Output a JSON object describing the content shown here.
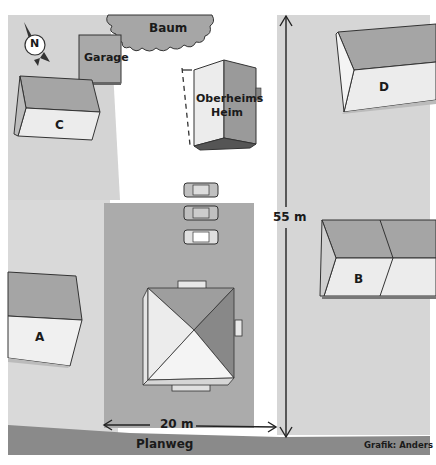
{
  "diagram": {
    "labels": {
      "tree": "Baum",
      "garage": "Garage",
      "main_house_line1": "Oberheims",
      "main_house_line2": "Heim",
      "house_a": "A",
      "house_b": "B",
      "house_c": "C",
      "house_d": "D",
      "north": "N",
      "height_dimension": "55 m",
      "width_dimension": "20 m",
      "street": "Planweg",
      "credit": "Grafik: Anders"
    },
    "parked_cars": 3,
    "colors": {
      "ground": "#d9d9d9",
      "plot": "#a9a9a9",
      "street": "#8a8a8a",
      "roof_dark": "#9a9a9a",
      "roof_light": "#ececec",
      "tree": "#a0a0a0",
      "line": "#2a2a2a"
    }
  }
}
